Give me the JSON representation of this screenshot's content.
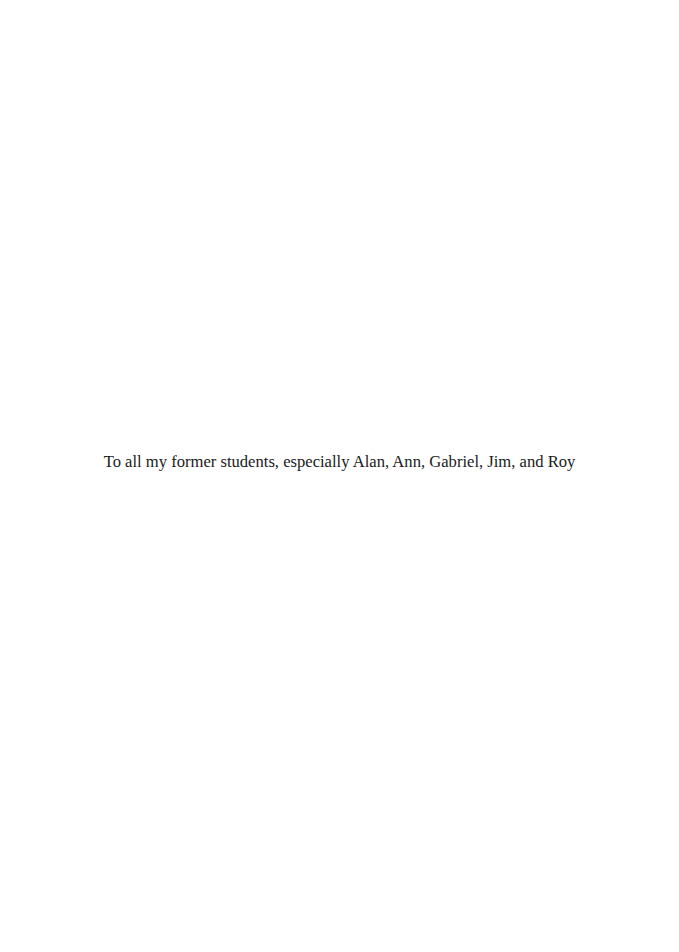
{
  "page": {
    "type": "dedication",
    "background_color": "#ffffff",
    "text_color": "#1a1a1a"
  },
  "dedication": {
    "text": "To all my former students, especially Alan, Ann, Gabriel, Jim, and Roy"
  }
}
